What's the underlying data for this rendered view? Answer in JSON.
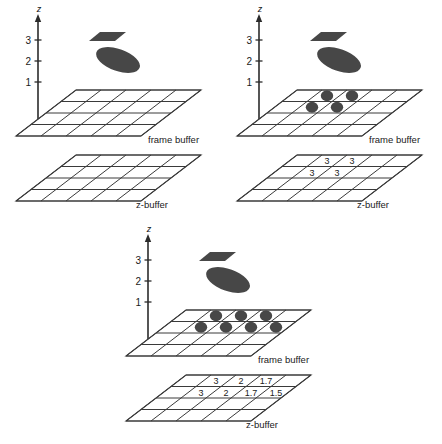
{
  "figure": {
    "caption": "",
    "axis": {
      "label": "z",
      "ticks": [
        "3",
        "2",
        "1"
      ]
    },
    "buffer_labels": {
      "frame": "frame buffer",
      "z": "z-buffer"
    },
    "colors": {
      "shape": "#474747",
      "grid_line": "#3a3a3a",
      "axis": "#2b2b2b",
      "background": "#ffffff",
      "dot": "#474747"
    },
    "grid": {
      "columns": 5,
      "rows": 4
    },
    "shapes": [
      {
        "name": "quad",
        "z": "3"
      },
      {
        "name": "ellipse",
        "z": "2"
      }
    ]
  },
  "chart_data": {
    "type": "diagram",
    "title": "",
    "panels": [
      {
        "id": "a",
        "name": "empty-buffers",
        "frame_buffer_pixels": [],
        "z_buffer_values": []
      },
      {
        "id": "b",
        "name": "after-first-polygon",
        "frame_buffer_pixels": [
          {
            "row": 0,
            "col": 1
          },
          {
            "row": 0,
            "col": 2
          },
          {
            "row": 1,
            "col": 1
          },
          {
            "row": 1,
            "col": 2
          }
        ],
        "z_buffer_values": [
          {
            "row": 0,
            "col": 1,
            "value": "3"
          },
          {
            "row": 0,
            "col": 2,
            "value": "3"
          },
          {
            "row": 1,
            "col": 1,
            "value": "3"
          },
          {
            "row": 1,
            "col": 2,
            "value": "3"
          }
        ]
      },
      {
        "id": "c",
        "name": "after-second-polygon",
        "frame_buffer_pixels": [
          {
            "row": 0,
            "col": 1
          },
          {
            "row": 0,
            "col": 2
          },
          {
            "row": 0,
            "col": 3
          },
          {
            "row": 1,
            "col": 1
          },
          {
            "row": 1,
            "col": 2
          },
          {
            "row": 1,
            "col": 3
          },
          {
            "row": 1,
            "col": 4
          }
        ],
        "z_buffer_values": [
          {
            "row": 0,
            "col": 1,
            "value": "3"
          },
          {
            "row": 0,
            "col": 2,
            "value": "2"
          },
          {
            "row": 0,
            "col": 3,
            "value": "1.7"
          },
          {
            "row": 1,
            "col": 1,
            "value": "3"
          },
          {
            "row": 1,
            "col": 2,
            "value": "2"
          },
          {
            "row": 1,
            "col": 3,
            "value": "1.7"
          },
          {
            "row": 1,
            "col": 4,
            "value": "1.5"
          }
        ]
      }
    ]
  }
}
